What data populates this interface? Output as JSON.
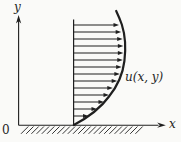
{
  "figure": {
    "colors": {
      "ink": "#1f1f1f",
      "background": "#fafaf8"
    },
    "labels": {
      "y_axis": "y",
      "x_axis": "x",
      "origin": "0",
      "velocity": "u(x, y)"
    },
    "paths": {
      "x_axis": "M 18.6 125.2 H 158.5",
      "x_axis_arrowhead": "165.8,125.2 157.2,122.6 159.8,125.2 157.2,127.8",
      "y_axis": "M 18.6 125.2 V 20.5",
      "y_axis_arrowhead": "18.6,15 16.0,23.6 18.6,21.0 21.2,23.6",
      "profile_baseline": "M 73.6 19.5 V 125",
      "profile_curve": "M 73.8 125 C 89 117, 101 107.5, 109 96.5 C 117.5 86, 122.8 74.5, 124.4 61 C 126 48, 125 34.5, 121.8 24.5 C 120.2 20, 118.3 15.5, 116.2 11"
    },
    "velocity_arrows": {
      "x_start": 73.6,
      "head_length": 5.5,
      "head_half_width": 2.1,
      "items": [
        {
          "y": 25,
          "tip_x": 119.0
        },
        {
          "y": 32,
          "tip_x": 121.2
        },
        {
          "y": 39,
          "tip_x": 122.7
        },
        {
          "y": 46,
          "tip_x": 123.4
        },
        {
          "y": 53,
          "tip_x": 123.4
        },
        {
          "y": 60,
          "tip_x": 122.8
        },
        {
          "y": 67,
          "tip_x": 121.7
        },
        {
          "y": 74,
          "tip_x": 119.9
        },
        {
          "y": 81,
          "tip_x": 117.2
        },
        {
          "y": 88,
          "tip_x": 112.8
        },
        {
          "y": 95,
          "tip_x": 109.0
        },
        {
          "y": 102,
          "tip_x": 104.0
        },
        {
          "y": 109,
          "tip_x": 97.0
        },
        {
          "y": 116,
          "tip_x": 88.5
        }
      ]
    },
    "ground_hatching": {
      "x_start": 21,
      "count": 23,
      "spacing": 5.2,
      "rise": 7.3,
      "y_bottom": 133.8,
      "y_top": 126.5
    }
  }
}
